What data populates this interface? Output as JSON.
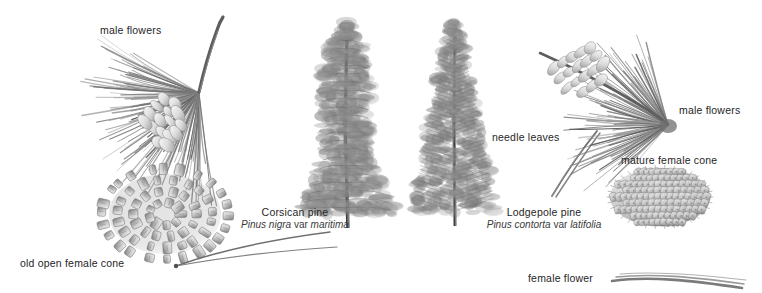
{
  "plate": {
    "title": "Pine comparison botanical plate",
    "background_color": "#ffffff",
    "ink_color": "#5a5a5a"
  },
  "labels": {
    "male_flowers_left": "male flowers",
    "male_flowers_right": "male flowers",
    "needle_leaves": "needle leaves",
    "mature_female_cone": "mature female cone",
    "old_open_female_cone": "old open female cone",
    "female_flower": "female flower"
  },
  "species": [
    {
      "common_name": "Corsican pine",
      "genus_species": "Pinus nigra",
      "rank": "var",
      "variety": "maritima"
    },
    {
      "common_name": "Lodgepole pine",
      "genus_species": "Pinus contorta",
      "rank": "var",
      "variety": "latifolia"
    }
  ],
  "figures": [
    {
      "name": "corsican-shoot-with-male-flowers"
    },
    {
      "name": "corsican-tree-habit"
    },
    {
      "name": "lodgepole-tree-habit"
    },
    {
      "name": "lodgepole-shoot-with-male-flowers"
    },
    {
      "name": "old-open-female-cone"
    },
    {
      "name": "mature-female-cone"
    },
    {
      "name": "needle-leaves-pair"
    },
    {
      "name": "female-flower-shoot"
    }
  ]
}
